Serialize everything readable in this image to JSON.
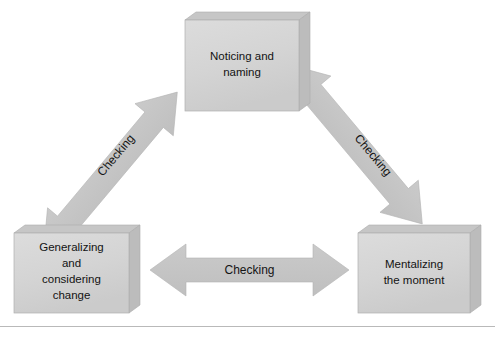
{
  "diagram": {
    "type": "cycle-triangle",
    "background_color": "#ffffff",
    "box_fill_color": "#d4d4d4",
    "box_top_color": "#c9c9c9",
    "box_side_color": "#bdbdbd",
    "box_edge_color": "#a8a8a8",
    "arrow_fill_color": "#c3c3c3",
    "text_color": "#131313",
    "rule_color": "#b9b9b9",
    "nodes": [
      {
        "id": "noticing-and-naming",
        "lines": [
          "Noticing and",
          "naming"
        ],
        "position": "top"
      },
      {
        "id": "generalizing-and-considering-change",
        "lines": [
          "Generalizing",
          "and",
          "considering",
          "change"
        ],
        "position": "bottom-left"
      },
      {
        "id": "mentalizing-the-moment",
        "lines": [
          "Mentalizing",
          "the moment"
        ],
        "position": "bottom-right"
      }
    ],
    "connectors": [
      {
        "id": "connector-left",
        "label": "Checking",
        "from": "generalizing-and-considering-change",
        "to": "noticing-and-naming",
        "style": "double-headed",
        "orientation": "diagonal-up-right"
      },
      {
        "id": "connector-right",
        "label": "Checking",
        "from": "noticing-and-naming",
        "to": "mentalizing-the-moment",
        "style": "double-headed",
        "orientation": "diagonal-down-right"
      },
      {
        "id": "connector-bottom",
        "label": "Checking",
        "from": "generalizing-and-considering-change",
        "to": "mentalizing-the-moment",
        "style": "double-headed",
        "orientation": "horizontal"
      }
    ],
    "footer_rule": true
  }
}
